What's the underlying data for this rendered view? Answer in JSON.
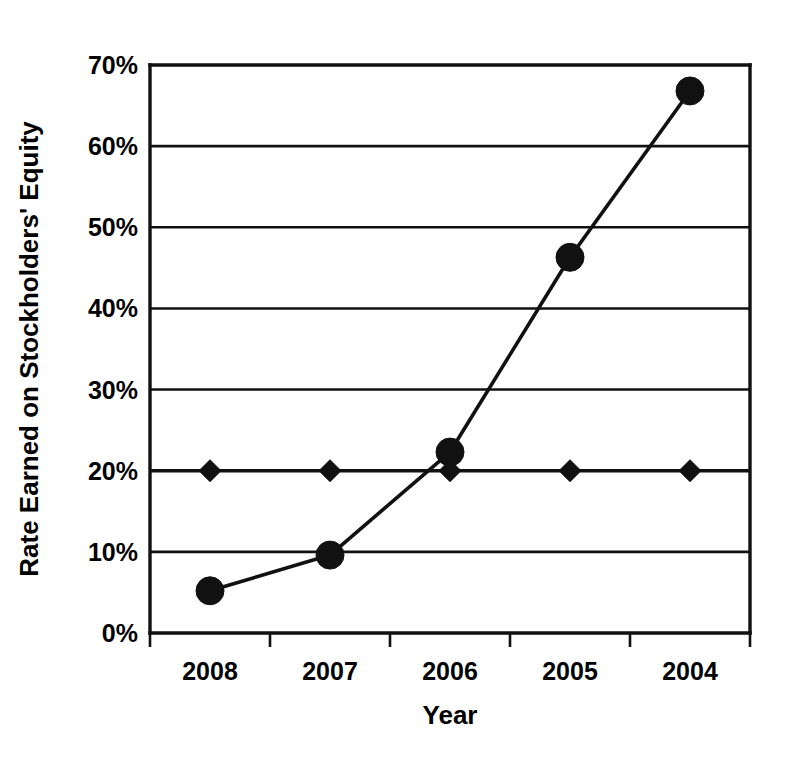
{
  "chart_data": {
    "type": "line",
    "title": "",
    "subtitle": "",
    "xlabel": "Year",
    "ylabel": "Rate Earned on Stockholders' Equity",
    "categories": [
      "2008",
      "2007",
      "2006",
      "2005",
      "2004"
    ],
    "ytick_labels": [
      "0%",
      "10%",
      "20%",
      "30%",
      "40%",
      "50%",
      "60%",
      "70%"
    ],
    "ytick_values": [
      0,
      10,
      20,
      30,
      40,
      50,
      60,
      70
    ],
    "ylim": [
      0,
      70
    ],
    "grid": "horizontal",
    "legend": "none",
    "series": [
      {
        "name": "Rate Earned on Stockholders' Equity",
        "marker": "circle",
        "values": [
          5.2,
          9.6,
          22.3,
          46.3,
          66.8
        ]
      },
      {
        "name": "Benchmark",
        "marker": "diamond",
        "values": [
          20.0,
          20.0,
          20.0,
          20.0,
          20.0
        ]
      }
    ],
    "colors": {
      "line": "#111111",
      "marker": "#111111",
      "grid": "#111111",
      "axis": "#111111",
      "background": "#ffffff"
    }
  }
}
